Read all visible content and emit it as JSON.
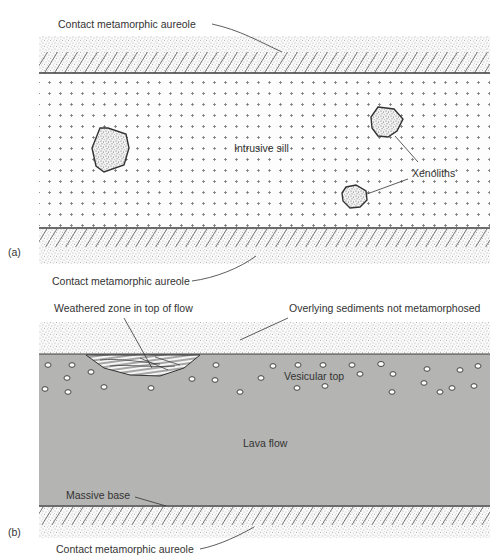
{
  "figure": {
    "panel_a": {
      "tag": "(a)",
      "labels": {
        "top_aureole": "Contact metamorphic aureole",
        "sill": "Intrusive sill",
        "xenoliths": "Xenoliths",
        "bottom_aureole": "Contact metamorphic aureole"
      }
    },
    "panel_b": {
      "tag": "(b)",
      "labels": {
        "weathered": "Weathered zone in top of flow",
        "overlying": "Overlying sediments not metamorphosed",
        "vesicular": "Vesicular top",
        "lava": "Lava flow",
        "massive_base": "Massive base",
        "bottom_aureole": "Contact metamorphic aureole"
      }
    }
  },
  "colors": {
    "lava_fill": "#b4b4b2",
    "line": "#3a3a3a",
    "stipple": "#555555",
    "background": "#ffffff"
  }
}
